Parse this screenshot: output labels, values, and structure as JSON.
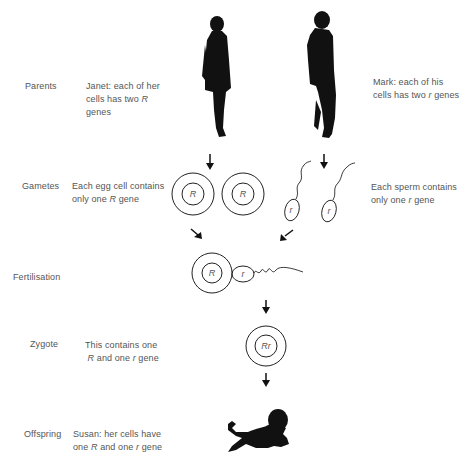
{
  "stages": [
    {
      "label": "Parents"
    },
    {
      "label": "Gametes"
    },
    {
      "label": "Fertilisation"
    },
    {
      "label": "Zygote"
    },
    {
      "label": "Offspring"
    }
  ],
  "descriptions": {
    "janet": {
      "line1": "Janet: each of her",
      "line2a": "cells has two ",
      "line2gene": "R",
      "line3": "genes"
    },
    "mark": {
      "line1": "Mark: each of his",
      "line2a": "cells has two ",
      "line2gene": "r",
      "line2b": " genes"
    },
    "egg": {
      "line1": "Each egg cell contains",
      "line2a": "only one ",
      "line2gene": "R",
      "line2b": " gene"
    },
    "sperm": {
      "line1": "Each sperm contains",
      "line2a": "only one ",
      "line2gene": "r",
      "line2b": " gene"
    },
    "zygote": {
      "line1": "This contains one",
      "line2gene1": "R",
      "line2a": " and one ",
      "line2gene2": "r",
      "line2b": " gene"
    },
    "offspring": {
      "line1": "Susan: her cells have",
      "line2a": "one ",
      "line2gene1": "R",
      "line2b": " and one ",
      "line2gene2": "r",
      "line2c": " gene"
    }
  },
  "genes": {
    "egg1": "R",
    "egg2": "R",
    "sperm1": "r",
    "sperm2": "r",
    "fert_egg": "R",
    "fert_sperm": "r",
    "zygote": "Rr"
  },
  "icons": {
    "mother": "woman-silhouette",
    "father": "man-silhouette",
    "baby": "baby-silhouette"
  },
  "colors": {
    "ink": "#111111",
    "text": "#555555",
    "background": "#ffffff"
  }
}
